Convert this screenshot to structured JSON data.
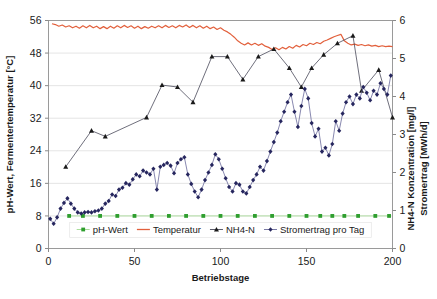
{
  "chart_data": {
    "type": "line",
    "title": "",
    "xlabel": "Betriebstage",
    "ylabel_left": "pH-Wert, Fermentertemperatur [°C]",
    "ylabel_right_line1": "NH4-N Konzentration [mg/l]",
    "ylabel_right_line2": "Stromertrag [MWh/d]",
    "xlim": [
      0,
      200
    ],
    "ylim_left": [
      0,
      56
    ],
    "ylim_right": [
      0,
      6
    ],
    "xticks": [
      0,
      50,
      100,
      150,
      200
    ],
    "yticks_left": [
      0,
      8,
      16,
      24,
      32,
      40,
      48,
      56
    ],
    "yticks_right": [
      0,
      1,
      2,
      3,
      4,
      5,
      6
    ],
    "grid": true,
    "legend_position": "inside-bottom-center",
    "series": [
      {
        "name": "pH-Wert",
        "axis": "left",
        "color": "#2e9e2e",
        "line_color": "#9fd98f",
        "marker": "square",
        "x": [
          12,
          20,
          30,
          40,
          50,
          60,
          70,
          80,
          90,
          100,
          110,
          120,
          130,
          140,
          150,
          158,
          165,
          172,
          180,
          190,
          198
        ],
        "y": [
          8.0,
          8.0,
          8.0,
          8.0,
          8.0,
          8.0,
          8.0,
          8.0,
          8.0,
          8.0,
          8.0,
          8.0,
          8.0,
          8.0,
          8.0,
          8.0,
          8.0,
          8.0,
          8.0,
          8.0,
          8.0
        ]
      },
      {
        "name": "Temperatur",
        "axis": "left",
        "color": "#e2603c",
        "line_color": "#e2603c",
        "marker": "none",
        "x": [
          2,
          4,
          6,
          8,
          10,
          12,
          14,
          16,
          18,
          20,
          22,
          24,
          26,
          28,
          30,
          32,
          34,
          36,
          38,
          40,
          42,
          44,
          46,
          48,
          50,
          52,
          54,
          56,
          58,
          60,
          62,
          64,
          66,
          68,
          70,
          72,
          74,
          76,
          78,
          80,
          82,
          84,
          86,
          88,
          90,
          92,
          94,
          96,
          98,
          100,
          102,
          104,
          106,
          108,
          110,
          112,
          114,
          116,
          118,
          120,
          122,
          124,
          126,
          128,
          130,
          132,
          134,
          136,
          138,
          140,
          142,
          144,
          146,
          148,
          150,
          152,
          154,
          156,
          158,
          160,
          162,
          164,
          166,
          168,
          170,
          172,
          174,
          176,
          178,
          180,
          182,
          184,
          186,
          188,
          190,
          192,
          194,
          196,
          198,
          200
        ],
        "y": [
          55.2,
          55.0,
          54.6,
          54.9,
          54.4,
          54.7,
          54.2,
          54.6,
          54.1,
          54.7,
          54.2,
          54.8,
          54.2,
          54.6,
          54.0,
          54.5,
          54.0,
          54.6,
          54.1,
          54.7,
          54.2,
          54.8,
          54.3,
          54.7,
          54.1,
          54.6,
          54.0,
          54.5,
          54.1,
          54.6,
          54.2,
          54.7,
          54.2,
          54.8,
          54.3,
          54.7,
          54.2,
          54.8,
          54.4,
          54.9,
          54.3,
          54.8,
          54.2,
          54.7,
          54.1,
          54.6,
          54.0,
          54.4,
          53.8,
          54.2,
          53.6,
          53.2,
          52.6,
          51.9,
          51.0,
          50.4,
          50.0,
          50.5,
          50.0,
          50.4,
          49.9,
          50.3,
          49.7,
          49.4,
          48.9,
          49.3,
          48.8,
          49.4,
          49.0,
          49.6,
          49.2,
          49.9,
          49.5,
          50.1,
          49.8,
          50.4,
          50.1,
          50.6,
          50.3,
          50.9,
          51.2,
          51.6,
          52.0,
          52.3,
          52.6,
          51.0,
          50.4,
          50.0,
          50.2,
          49.9,
          50.1,
          49.8,
          50.0,
          49.7,
          49.9,
          49.6,
          49.8,
          49.6,
          49.7,
          49.6
        ]
      },
      {
        "name": "NH4-N",
        "axis": "right",
        "color": "#1a1a1a",
        "line_color": "#4a4a5a",
        "marker": "triangle",
        "x": [
          10,
          25,
          33,
          57,
          66,
          75,
          84,
          95,
          104,
          113,
          122,
          131,
          140,
          147,
          153,
          160,
          168,
          177,
          182,
          192,
          200
        ],
        "y": [
          2.15,
          3.1,
          2.95,
          3.45,
          4.3,
          4.25,
          3.85,
          5.05,
          5.05,
          4.45,
          5.05,
          5.25,
          4.75,
          4.25,
          4.75,
          5.1,
          5.4,
          5.6,
          4.15,
          4.7,
          3.45
        ]
      },
      {
        "name": "Stromertrag pro Tag",
        "axis": "right",
        "color": "#26265e",
        "line_color": "#6a6a9a",
        "marker": "diamond",
        "x": [
          1,
          3,
          5,
          7,
          9,
          11,
          13,
          15,
          17,
          19,
          21,
          23,
          25,
          27,
          29,
          31,
          33,
          35,
          37,
          39,
          41,
          43,
          45,
          47,
          49,
          51,
          53,
          55,
          57,
          59,
          61,
          63,
          65,
          67,
          69,
          71,
          73,
          75,
          77,
          79,
          81,
          83,
          85,
          87,
          89,
          91,
          93,
          95,
          97,
          99,
          101,
          103,
          105,
          107,
          109,
          111,
          113,
          115,
          117,
          119,
          121,
          123,
          125,
          127,
          129,
          131,
          133,
          135,
          137,
          139,
          141,
          143,
          145,
          147,
          149,
          151,
          153,
          155,
          157,
          159,
          161,
          163,
          165,
          167,
          169,
          171,
          173,
          175,
          177,
          179,
          181,
          183,
          185,
          187,
          189,
          191,
          193,
          195,
          197,
          199
        ],
        "y": [
          0.78,
          0.65,
          0.82,
          1.05,
          1.2,
          1.32,
          1.18,
          1.05,
          0.95,
          0.92,
          0.95,
          0.96,
          0.95,
          0.98,
          1.0,
          1.05,
          1.18,
          1.25,
          1.42,
          1.38,
          1.55,
          1.6,
          1.72,
          1.68,
          1.82,
          1.95,
          1.9,
          2.05,
          2.0,
          1.95,
          2.1,
          1.55,
          2.15,
          2.2,
          2.25,
          2.18,
          1.98,
          2.25,
          2.35,
          2.4,
          1.95,
          1.7,
          1.5,
          1.35,
          1.55,
          1.8,
          2.0,
          2.2,
          2.48,
          2.35,
          2.1,
          1.85,
          1.62,
          1.5,
          1.72,
          1.68,
          1.5,
          1.45,
          1.62,
          1.8,
          1.95,
          2.15,
          2.05,
          2.3,
          2.55,
          2.8,
          3.05,
          3.35,
          3.6,
          3.85,
          4.05,
          3.6,
          3.2,
          3.75,
          4.2,
          3.95,
          3.3,
          2.95,
          3.15,
          2.55,
          2.65,
          2.45,
          2.75,
          3.35,
          3.1,
          3.55,
          3.85,
          4.0,
          3.8,
          4.05,
          3.95,
          4.25,
          4.1,
          3.9,
          4.15,
          4.05,
          4.35,
          4.2,
          4.05,
          4.55
        ]
      }
    ],
    "legend": [
      {
        "label": "pH-Wert",
        "color": "#2e9e2e",
        "line_color": "#9fd98f",
        "marker": "square"
      },
      {
        "label": "Temperatur",
        "color": "#e2603c",
        "line_color": "#e2603c",
        "marker": "none"
      },
      {
        "label": "NH4-N",
        "color": "#1a1a1a",
        "line_color": "#4a4a5a",
        "marker": "triangle"
      },
      {
        "label": "Stromertrag pro Tag",
        "color": "#26265e",
        "line_color": "#6a6a9a",
        "marker": "diamond"
      }
    ]
  }
}
